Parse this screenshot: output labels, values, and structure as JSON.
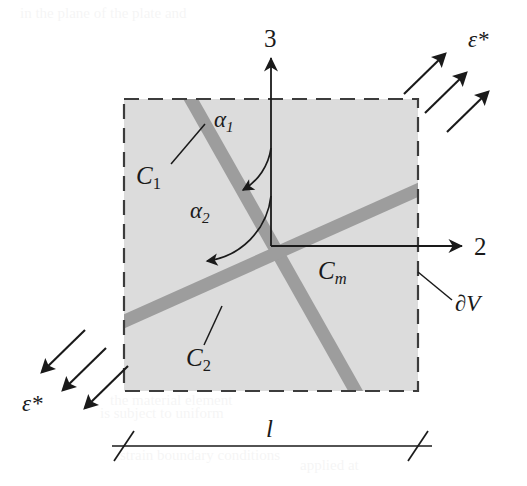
{
  "figure": {
    "type": "technical-diagram",
    "colors": {
      "background": "#ffffff",
      "rve_fill": "#dcdcdc",
      "band_fill": "#9d9d9d",
      "stroke": "#1a1a1a",
      "dashed_border": "#4a4a4a"
    },
    "rve": {
      "x": 124,
      "y": 99,
      "width": 294,
      "height": 292,
      "border_style": "dashed",
      "boundary_label": "∂V"
    },
    "axes": {
      "origin": {
        "x": 271,
        "y": 246
      },
      "vertical": {
        "label": "3",
        "tip_y": 56,
        "label_x": 271,
        "label_y": 40
      },
      "horizontal": {
        "label": "2",
        "tip_x": 466,
        "label_x": 482,
        "label_y": 247
      }
    },
    "bands": [
      {
        "name": "C1",
        "label": "C",
        "subscript": "1",
        "angle_deg": 28,
        "thickness": 13,
        "label_x": 146,
        "label_y": 178
      },
      {
        "name": "C2",
        "label": "C",
        "subscript": "2",
        "angle_deg": 110,
        "thickness": 13,
        "label_x": 196,
        "label_y": 360
      },
      {
        "name": "Cm",
        "label": "C",
        "subscript": "m",
        "matrix": true,
        "label_x": 330,
        "label_y": 272
      }
    ],
    "angles": [
      {
        "name": "alpha1",
        "symbol": "α",
        "subscript": "1",
        "label_x": 226,
        "label_y": 123
      },
      {
        "name": "alpha2",
        "symbol": "α",
        "subscript": "2",
        "label_x": 201,
        "label_y": 214
      }
    ],
    "loads": [
      {
        "name": "epsilon-star-top-right",
        "symbol": "ε*",
        "direction": "up-right",
        "label_x": 478,
        "label_y": 41,
        "arrow_count": 3
      },
      {
        "name": "epsilon-star-bottom-left",
        "symbol": "ε*",
        "direction": "down-left",
        "label_x": 32,
        "label_y": 404,
        "arrow_count": 3
      }
    ],
    "dimension": {
      "label": "l",
      "label_x": 271,
      "label_y": 430,
      "line_y": 446,
      "x_start": 124,
      "x_end": 418
    }
  }
}
